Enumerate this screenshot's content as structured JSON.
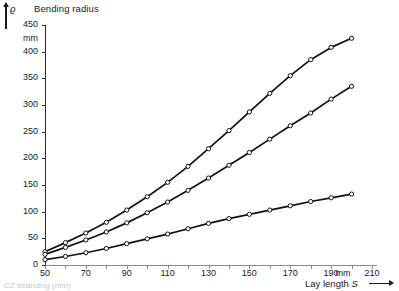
{
  "chart_data": {
    "type": "line",
    "title": "Bending radius",
    "ylabel": "Bending radius",
    "y_symbol": "ϱ",
    "yunit": "mm",
    "xlabel": "Lay length S",
    "x_symbol": "S",
    "xunit": "mm",
    "xlim": [
      50,
      210
    ],
    "ylim": [
      0,
      450
    ],
    "xticks": [
      50,
      60,
      70,
      80,
      90,
      100,
      110,
      120,
      130,
      140,
      150,
      160,
      170,
      180,
      190,
      200,
      210
    ],
    "xtick_labels": [
      "50",
      "",
      "70",
      "",
      "90",
      "",
      "110",
      "",
      "130",
      "",
      "150",
      "",
      "170",
      "",
      "190",
      "",
      "210"
    ],
    "yticks": [
      0,
      50,
      100,
      150,
      200,
      250,
      300,
      350,
      400,
      450
    ],
    "ytick_labels": [
      "0",
      "50",
      "100",
      "150",
      "200",
      "250",
      "300",
      "350",
      "400",
      "450"
    ],
    "grid": false,
    "legend": "none",
    "marker": "open-circle",
    "line_color": "#111111",
    "x": [
      50,
      60,
      70,
      80,
      90,
      100,
      110,
      120,
      130,
      140,
      150,
      160,
      170,
      180,
      190,
      200
    ],
    "series": [
      {
        "name": "curve-upper",
        "values": [
          25,
          42,
          60,
          80,
          103,
          128,
          155,
          185,
          218,
          252,
          287,
          322,
          355,
          385,
          408,
          425
        ]
      },
      {
        "name": "curve-middle",
        "values": [
          20,
          33,
          47,
          62,
          79,
          98,
          118,
          140,
          163,
          187,
          211,
          236,
          261,
          285,
          311,
          335
        ]
      },
      {
        "name": "curve-lower",
        "values": [
          10,
          16,
          23,
          31,
          40,
          49,
          58,
          68,
          78,
          87,
          95,
          103,
          111,
          119,
          126,
          133
        ]
      }
    ]
  },
  "caption": "CZ stranding (mm)"
}
